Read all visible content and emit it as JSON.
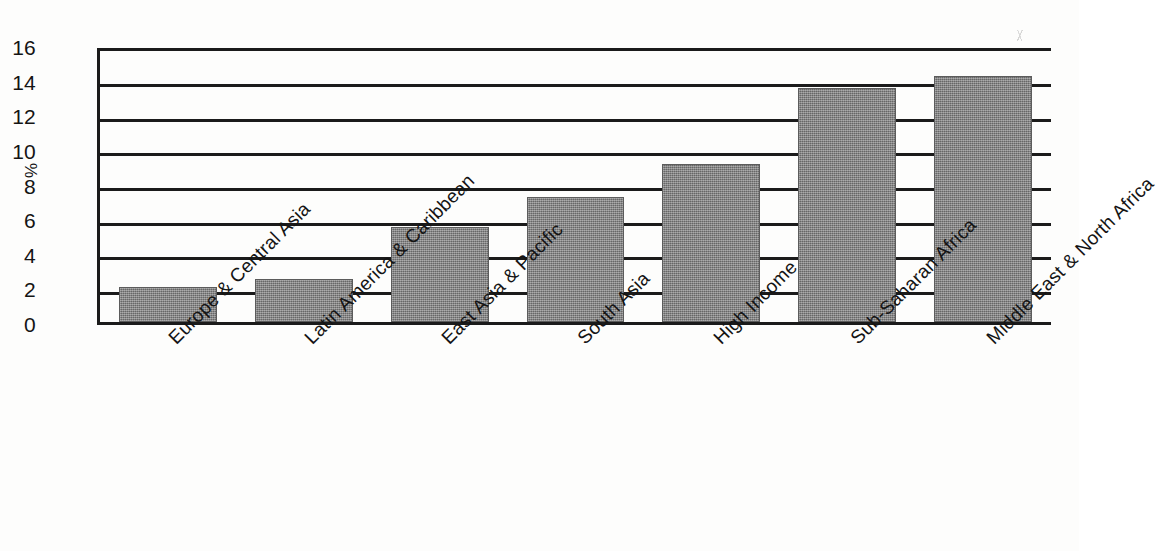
{
  "chart_data": {
    "type": "bar",
    "title": "",
    "subtitle": "",
    "xlabel": "",
    "ylabel": "%",
    "ylim": [
      0,
      16
    ],
    "yticks": [
      0,
      2,
      4,
      6,
      8,
      10,
      12,
      14,
      16
    ],
    "ytick_labels": [
      "0",
      "2",
      "4",
      "6",
      "8",
      "10",
      "12",
      "14",
      "16"
    ],
    "grid": true,
    "grid_axis": "y",
    "legend": false,
    "legend_position": "none",
    "orientation": "vertical",
    "bar_color": "#7d7d7d",
    "axis_color": "#1b1b1b",
    "background_color": "#fdfdfc",
    "categories": [
      "Europe & Central Asia",
      "Latin America & Caribbean",
      "East Asia & Pacific",
      "South Asia",
      "High Income",
      "Sub-Saharan Africa",
      "Middle East & North Africa"
    ],
    "values": [
      2.0,
      2.5,
      5.5,
      7.2,
      9.1,
      13.5,
      14.2
    ],
    "annotations": []
  },
  "figure": {
    "caption": "",
    "speck_icon": "scanner-speck-icon"
  }
}
